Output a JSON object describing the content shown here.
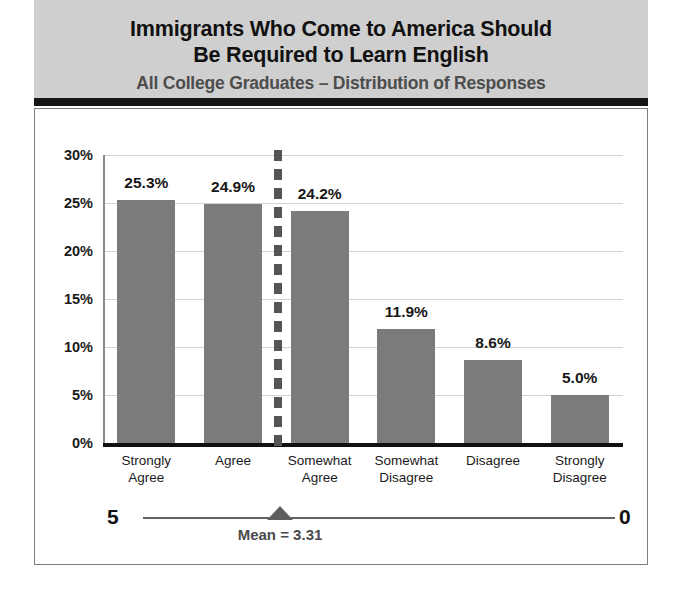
{
  "header": {
    "title_line1": "Immigrants Who Come to America Should",
    "title_line2": "Be Required to Learn English",
    "subtitle": "All College Graduates – Distribution of Responses"
  },
  "colors": {
    "header_band": "#cfcfcf",
    "header_rule": "#151515",
    "bar_fill": "#7b7b7b",
    "gridline": "#d2d2d2",
    "axis": "#111111",
    "subtitle_text": "#4d4d4d",
    "divider": "#555555",
    "marker": "#5e5e5e"
  },
  "scale": {
    "left_label": "5",
    "right_label": "0",
    "mean_label": "Mean = 3.31",
    "mean_value": 3.31
  },
  "chart_data": {
    "type": "bar",
    "title": "Immigrants Who Come to America Should Be Required to Learn English",
    "subtitle": "All College Graduates – Distribution of Responses",
    "xlabel": "",
    "ylabel": "",
    "ylim": [
      0,
      30
    ],
    "ytick_labels": [
      "30%",
      "25%",
      "20%",
      "15%",
      "10%",
      "5%",
      "0%"
    ],
    "ytick_values": [
      30,
      25,
      20,
      15,
      10,
      5,
      0
    ],
    "grid": true,
    "legend": false,
    "categories": [
      "Strongly Agree",
      "Agree",
      "Somewhat Agree",
      "Somewhat Disagree",
      "Disagree",
      "Strongly Disagree"
    ],
    "category_lines": [
      [
        "Strongly",
        "Agree"
      ],
      [
        "Agree",
        ""
      ],
      [
        "Somewhat",
        "Agree"
      ],
      [
        "Somewhat",
        "Disagree"
      ],
      [
        "Disagree",
        ""
      ],
      [
        "Strongly",
        "Disagree"
      ]
    ],
    "values": [
      25.3,
      24.9,
      24.2,
      11.9,
      8.6,
      5.0
    ],
    "value_labels": [
      "25.3%",
      "24.9%",
      "24.2%",
      "11.9%",
      "8.6%",
      "5.0%"
    ],
    "annotations": [
      {
        "name": "mean-divider",
        "type": "vertical-dashed-line",
        "between_categories": [
          2,
          3
        ]
      },
      {
        "name": "mean-marker",
        "type": "triangle",
        "label": "Mean = 3.31",
        "value": 3.31,
        "scale_min": 0,
        "scale_max": 5
      }
    ]
  }
}
